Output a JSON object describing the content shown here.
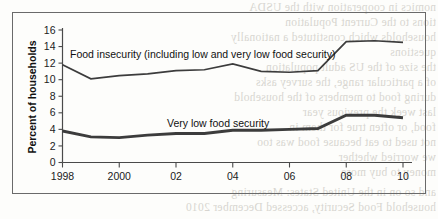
{
  "figure": {
    "y_axis_title": "Percent of households"
  },
  "chart_data": {
    "type": "line",
    "title": "",
    "xlabel": "",
    "ylabel": "Percent of households",
    "xlim": [
      1998,
      2010
    ],
    "ylim": [
      0,
      16
    ],
    "ytick_step": 2,
    "grid": false,
    "legend": "inline-labels",
    "x": [
      1998,
      1999,
      2000,
      2001,
      2002,
      2003,
      2004,
      2005,
      2006,
      2007,
      2008,
      2009,
      2010
    ],
    "xtick_values": [
      1998,
      2000,
      2002,
      2004,
      2006,
      2008,
      2010
    ],
    "xtick_labels": [
      "1998",
      "2000",
      "02",
      "04",
      "06",
      "08",
      "10"
    ],
    "ytick_labels": [
      "0",
      "2",
      "4",
      "6",
      "8",
      "10",
      "12",
      "14",
      "16"
    ],
    "series": [
      {
        "name": "Food insecurity (including low and very low food security)",
        "label": "Food insecurity (including low and very low food security)",
        "color": "#3c3c3c",
        "line_width": 1.7,
        "values": [
          11.8,
          10.1,
          10.5,
          10.7,
          11.1,
          11.2,
          11.9,
          11.0,
          10.9,
          11.1,
          14.6,
          14.7,
          14.5
        ]
      },
      {
        "name": "Very low food security",
        "label": "Very low food security",
        "color": "#3c3c3c",
        "line_width": 2.9,
        "values": [
          3.8,
          3.1,
          3.0,
          3.3,
          3.5,
          3.5,
          3.9,
          3.9,
          4.0,
          4.1,
          5.7,
          5.7,
          5.4
        ]
      }
    ]
  },
  "bleed_text": {
    "lines": [
      "nomics in cooperation with the USDA",
      "tions to the Current Population",
      "households which constituted a nationally",
      "questions",
      "the size of the US adult population",
      "of a particular range, the survey asks",
      "during food to members of the household",
      "last week the previous year",
      "food, or often true for them in",
      "not used to eat because food was too",
      "we worried whether",
      "money to buy more",
      "and so on in the United States: Measuring",
      "household Food Security, accessed December 2010"
    ]
  }
}
